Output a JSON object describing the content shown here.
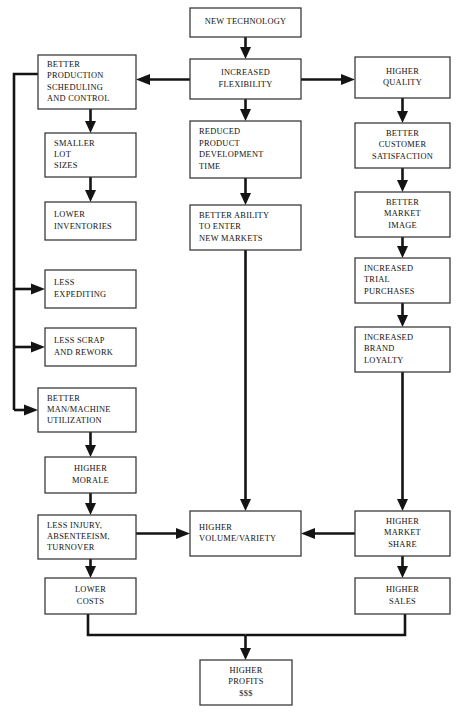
{
  "diagram": {
    "background_color": "#ffffff",
    "box_fill": "#ffffff",
    "box_stroke": "#333333",
    "connector_color": "#141414",
    "nodes": [
      {
        "id": "new-technology",
        "name": "new-technology",
        "lines": [
          "NEW TECHNOLOGY"
        ],
        "align": "center",
        "x": 190,
        "y": 8,
        "w": 111,
        "h": 29
      },
      {
        "id": "increased-flexibility",
        "name": "increased-flexibility",
        "lines": [
          "INCREASED",
          "FLEXIBILITY"
        ],
        "align": "center",
        "x": 190,
        "y": 59,
        "w": 111,
        "h": 40
      },
      {
        "id": "reduced-product-development-time",
        "name": "reduced-product-development-time",
        "lines": [
          "REDUCED",
          "PRODUCT",
          "DEVELOPMENT",
          "TIME"
        ],
        "align": "left",
        "x": 190,
        "y": 121,
        "w": 111,
        "h": 57
      },
      {
        "id": "better-ability-to-enter-new-markets",
        "name": "better-ability-to-enter-new-markets",
        "lines": [
          "BETTER ABILITY",
          "TO ENTER",
          "NEW MARKETS"
        ],
        "align": "left",
        "x": 190,
        "y": 205,
        "w": 111,
        "h": 45
      },
      {
        "id": "higher-volume-variety",
        "name": "higher-volume-variety",
        "lines": [
          "HIGHER",
          "VOLUME/VARIETY"
        ],
        "align": "left",
        "x": 190,
        "y": 511,
        "w": 111,
        "h": 45
      },
      {
        "id": "higher-profits",
        "name": "higher-profits",
        "lines": [
          "HIGHER",
          "PROFITS",
          "$$$"
        ],
        "align": "center",
        "x": 200,
        "y": 660,
        "w": 92,
        "h": 45
      },
      {
        "id": "better-production-scheduling-and-control",
        "name": "better-production-scheduling-and-control",
        "lines": [
          "BETTER",
          "PRODUCTION",
          "SCHEDULING",
          "AND CONTROL"
        ],
        "align": "left",
        "x": 38,
        "y": 55,
        "w": 98,
        "h": 54
      },
      {
        "id": "smaller-lot-sizes",
        "name": "smaller-lot-sizes",
        "lines": [
          "SMALLER",
          "LOT",
          "SIZES"
        ],
        "align": "left",
        "x": 45,
        "y": 133,
        "w": 91,
        "h": 44
      },
      {
        "id": "lower-inventories",
        "name": "lower-inventories",
        "lines": [
          "LOWER",
          "INVENTORIES"
        ],
        "align": "left",
        "x": 45,
        "y": 202,
        "w": 91,
        "h": 38
      },
      {
        "id": "less-expediting",
        "name": "less-expediting",
        "lines": [
          "LESS",
          "EXPEDITING"
        ],
        "align": "left",
        "x": 45,
        "y": 270,
        "w": 91,
        "h": 38
      },
      {
        "id": "less-scrap-and-rework",
        "name": "less-scrap-and-rework",
        "lines": [
          "LESS SCRAP",
          "AND REWORK"
        ],
        "align": "left",
        "x": 45,
        "y": 328,
        "w": 91,
        "h": 38
      },
      {
        "id": "better-man-machine-utilization",
        "name": "better-man-machine-utilization",
        "lines": [
          "BETTER",
          "MAN/MACHINE",
          "UTILIZATION"
        ],
        "align": "left",
        "x": 38,
        "y": 388,
        "w": 98,
        "h": 44
      },
      {
        "id": "higher-morale",
        "name": "higher-morale",
        "lines": [
          "HIGHER",
          "MORALE"
        ],
        "align": "center",
        "x": 45,
        "y": 457,
        "w": 91,
        "h": 36
      },
      {
        "id": "less-injury-absenteeism-turnover",
        "name": "less-injury-absenteeism-turnover",
        "lines": [
          "LESS INJURY,",
          "ABSENTEEISM,",
          "TURNOVER"
        ],
        "align": "left",
        "x": 38,
        "y": 515,
        "w": 98,
        "h": 44
      },
      {
        "id": "lower-costs",
        "name": "lower-costs",
        "lines": [
          "LOWER",
          "COSTS"
        ],
        "align": "center",
        "x": 45,
        "y": 578,
        "w": 91,
        "h": 36
      },
      {
        "id": "higher-quality",
        "name": "higher-quality",
        "lines": [
          "HIGHER",
          "QUALITY"
        ],
        "align": "center",
        "x": 355,
        "y": 57,
        "w": 95,
        "h": 41
      },
      {
        "id": "better-customer-satisfaction",
        "name": "better-customer-satisfaction",
        "lines": [
          "BETTER",
          "CUSTOMER",
          "SATISFACTION"
        ],
        "align": "center",
        "x": 355,
        "y": 123,
        "w": 95,
        "h": 45
      },
      {
        "id": "better-market-image",
        "name": "better-market-image",
        "lines": [
          "BETTER",
          "MARKET",
          "IMAGE"
        ],
        "align": "center",
        "x": 355,
        "y": 192,
        "w": 95,
        "h": 45
      },
      {
        "id": "increased-trial-purchases",
        "name": "increased-trial-purchases",
        "lines": [
          "INCREASED",
          "TRIAL",
          "PURCHASES"
        ],
        "align": "left",
        "x": 355,
        "y": 258,
        "w": 95,
        "h": 45
      },
      {
        "id": "increased-brand-loyalty",
        "name": "increased-brand-loyalty",
        "lines": [
          "INCREASED",
          "BRAND",
          "LOYALTY"
        ],
        "align": "left",
        "x": 355,
        "y": 327,
        "w": 95,
        "h": 45
      },
      {
        "id": "higher-market-share",
        "name": "higher-market-share",
        "lines": [
          "HIGHER",
          "MARKET",
          "SHARE"
        ],
        "align": "center",
        "x": 355,
        "y": 511,
        "w": 95,
        "h": 45
      },
      {
        "id": "higher-sales",
        "name": "higher-sales",
        "lines": [
          "HIGHER",
          "SALES"
        ],
        "align": "center",
        "x": 355,
        "y": 578,
        "w": 95,
        "h": 36
      }
    ],
    "edges": [
      {
        "name": "edge-new-technology-to-increased-flexibility",
        "from": "new-technology",
        "to": "increased-flexibility"
      },
      {
        "name": "edge-increased-flexibility-to-better-production",
        "from": "increased-flexibility",
        "to": "better-production-scheduling-and-control"
      },
      {
        "name": "edge-increased-flexibility-to-higher-quality",
        "from": "increased-flexibility",
        "to": "higher-quality"
      },
      {
        "name": "edge-increased-flexibility-to-reduced-product-development-time",
        "from": "increased-flexibility",
        "to": "reduced-product-development-time"
      },
      {
        "name": "edge-reduced-product-development-time-to-better-ability",
        "from": "reduced-product-development-time",
        "to": "better-ability-to-enter-new-markets"
      },
      {
        "name": "edge-better-ability-to-higher-volume-variety",
        "from": "better-ability-to-enter-new-markets",
        "to": "higher-volume-variety"
      },
      {
        "name": "edge-better-production-to-smaller-lot-sizes",
        "from": "better-production-scheduling-and-control",
        "to": "smaller-lot-sizes"
      },
      {
        "name": "edge-smaller-lot-sizes-to-lower-inventories",
        "from": "smaller-lot-sizes",
        "to": "lower-inventories"
      },
      {
        "name": "edge-better-production-spine-to-less-expediting",
        "from": "better-production-scheduling-and-control",
        "to": "less-expediting"
      },
      {
        "name": "edge-better-production-spine-to-less-scrap-and-rework",
        "from": "better-production-scheduling-and-control",
        "to": "less-scrap-and-rework"
      },
      {
        "name": "edge-better-production-spine-to-better-man-machine-utilization",
        "from": "better-production-scheduling-and-control",
        "to": "better-man-machine-utilization"
      },
      {
        "name": "edge-better-man-machine-to-higher-morale",
        "from": "better-man-machine-utilization",
        "to": "higher-morale"
      },
      {
        "name": "edge-higher-morale-to-less-injury",
        "from": "higher-morale",
        "to": "less-injury-absenteeism-turnover"
      },
      {
        "name": "edge-less-injury-to-lower-costs",
        "from": "less-injury-absenteeism-turnover",
        "to": "lower-costs"
      },
      {
        "name": "edge-less-injury-to-higher-volume-variety",
        "from": "less-injury-absenteeism-turnover",
        "to": "higher-volume-variety"
      },
      {
        "name": "edge-higher-quality-to-better-customer-satisfaction",
        "from": "higher-quality",
        "to": "better-customer-satisfaction"
      },
      {
        "name": "edge-better-customer-satisfaction-to-better-market-image",
        "from": "better-customer-satisfaction",
        "to": "better-market-image"
      },
      {
        "name": "edge-better-market-image-to-increased-trial-purchases",
        "from": "better-market-image",
        "to": "increased-trial-purchases"
      },
      {
        "name": "edge-increased-trial-purchases-to-increased-brand-loyalty",
        "from": "increased-trial-purchases",
        "to": "increased-brand-loyalty"
      },
      {
        "name": "edge-increased-brand-loyalty-to-higher-market-share",
        "from": "increased-brand-loyalty",
        "to": "higher-market-share"
      },
      {
        "name": "edge-higher-market-share-to-higher-volume-variety",
        "from": "higher-market-share",
        "to": "higher-volume-variety"
      },
      {
        "name": "edge-higher-market-share-to-higher-sales",
        "from": "higher-market-share",
        "to": "higher-sales"
      },
      {
        "name": "edge-lower-costs-to-higher-profits",
        "from": "lower-costs",
        "to": "higher-profits"
      },
      {
        "name": "edge-higher-sales-to-higher-profits",
        "from": "higher-sales",
        "to": "higher-profits"
      }
    ]
  }
}
